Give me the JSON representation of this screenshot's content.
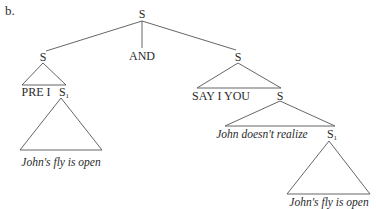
{
  "figure_label": "b.",
  "nodes": {
    "root": "S",
    "conj": "AND",
    "left_s": "S",
    "left_pre": "PRE I",
    "left_s1": "S",
    "left_s1_sub": "1",
    "left_s1_yield": "John's fly is open",
    "right_s": "S",
    "right_say": "SAY I YOU",
    "right_inner_s": "S",
    "right_realize": "John doesn't realize",
    "right_s1": "S",
    "right_s1_sub": "1",
    "right_s1_yield": "John's fly is open"
  },
  "colors": {
    "line": "#555555",
    "text": "#2a2a2a"
  }
}
